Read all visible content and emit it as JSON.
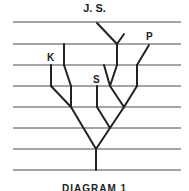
{
  "diagram": {
    "title": "J. S.",
    "caption": "DIAGRAM 1",
    "labels": {
      "k": "K",
      "s": "S",
      "p": "P"
    },
    "line_color": "#4a4a4a",
    "tree_color": "#222222"
  }
}
